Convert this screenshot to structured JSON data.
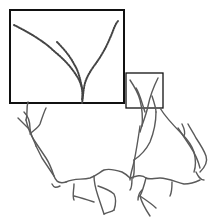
{
  "figure": {
    "colors": {
      "background": "#ffffff",
      "frame": "#111111",
      "trace": "#555555",
      "dotted_trace": "#444444"
    },
    "inset": {
      "x": 10,
      "y": 10,
      "width": 114,
      "height": 93,
      "label": ""
    },
    "roi_box": {
      "x": 126,
      "y": 73,
      "width": 37,
      "height": 35
    }
  }
}
